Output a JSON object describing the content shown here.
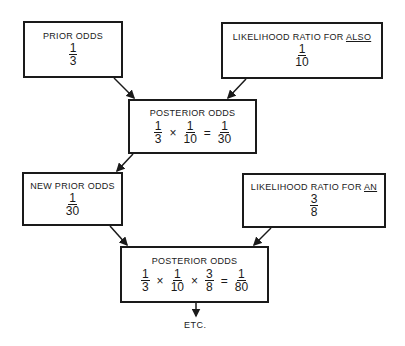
{
  "prior": {
    "label": "PRIOR ODDS",
    "num": "1",
    "den": "3"
  },
  "lr_also": {
    "label_prefix": "LIKELIHOOD RATIO FOR ",
    "word": "ALSO",
    "num": "1",
    "den": "10"
  },
  "posterior1": {
    "label": "POSTERIOR ODDS",
    "terms": [
      {
        "num": "1",
        "den": "3"
      },
      {
        "num": "1",
        "den": "10"
      }
    ],
    "ops": [
      "×",
      "="
    ],
    "result": {
      "num": "1",
      "den": "30"
    }
  },
  "new_prior": {
    "label": "NEW PRIOR ODDS",
    "num": "1",
    "den": "30"
  },
  "lr_an": {
    "label_prefix": "LIKELIHOOD RATIO FOR ",
    "word": "AN",
    "num": "3",
    "den": "8"
  },
  "posterior2": {
    "label": "POSTERIOR ODDS",
    "terms": [
      {
        "num": "1",
        "den": "3"
      },
      {
        "num": "1",
        "den": "10"
      },
      {
        "num": "3",
        "den": "8"
      }
    ],
    "ops": [
      "×",
      "×",
      "="
    ],
    "result": {
      "num": "1",
      "den": "80"
    }
  },
  "etc": "ETC."
}
